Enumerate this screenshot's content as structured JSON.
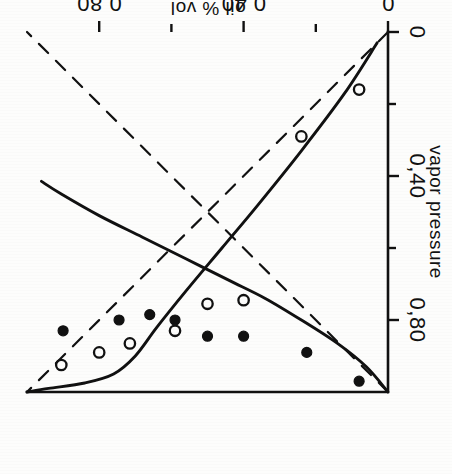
{
  "figure": {
    "rotation_deg": 180,
    "background_color": "#fdfdfc",
    "ink_color": "#111111"
  },
  "chart_data": {
    "type": "scatter",
    "title": "",
    "subtitle": "",
    "xlabel": "oil % vol",
    "ylabel": "vapor pressure",
    "xlim": [
      0,
      1.0
    ],
    "ylim": [
      0,
      1.0
    ],
    "grid": false,
    "legend_position": "none",
    "decimal_separator": ",",
    "x_ticks": [
      {
        "value": 0.0,
        "label": "0",
        "major": true
      },
      {
        "value": 0.2,
        "label": "",
        "major": false
      },
      {
        "value": 0.4,
        "label": "0,40",
        "major": true
      },
      {
        "value": 0.6,
        "label": "",
        "major": false
      },
      {
        "value": 0.8,
        "label": "0,80",
        "major": true
      }
    ],
    "y_ticks": [
      {
        "value": 0.0,
        "label": "0",
        "major": true
      },
      {
        "value": 0.2,
        "label": "",
        "major": false
      },
      {
        "value": 0.4,
        "label": "0,40",
        "major": true
      },
      {
        "value": 0.6,
        "label": "",
        "major": false
      },
      {
        "value": 0.8,
        "label": "0,80",
        "major": true
      }
    ],
    "series": [
      {
        "name": "filled-circles",
        "marker": "filled-circle",
        "type": "scatter",
        "points": [
          {
            "x": 0.08,
            "y": 0.97
          },
          {
            "x": 0.225,
            "y": 0.89
          },
          {
            "x": 0.4,
            "y": 0.845
          },
          {
            "x": 0.5,
            "y": 0.845
          },
          {
            "x": 0.59,
            "y": 0.8
          },
          {
            "x": 0.66,
            "y": 0.785
          },
          {
            "x": 0.745,
            "y": 0.8
          },
          {
            "x": 0.9,
            "y": 0.83
          }
        ]
      },
      {
        "name": "open-circles",
        "marker": "open-circle",
        "type": "scatter",
        "points": [
          {
            "x": 0.08,
            "y": 0.16
          },
          {
            "x": 0.24,
            "y": 0.29
          },
          {
            "x": 0.4,
            "y": 0.745
          },
          {
            "x": 0.5,
            "y": 0.755
          },
          {
            "x": 0.59,
            "y": 0.83
          },
          {
            "x": 0.715,
            "y": 0.865
          },
          {
            "x": 0.8,
            "y": 0.89
          },
          {
            "x": 0.905,
            "y": 0.925
          }
        ]
      },
      {
        "name": "dew-curve",
        "marker": "none",
        "type": "line",
        "style": "solid",
        "points": [
          {
            "x": 0.0,
            "y": 1.0
          },
          {
            "x": 0.06,
            "y": 0.93
          },
          {
            "x": 0.14,
            "y": 0.865
          },
          {
            "x": 0.24,
            "y": 0.8
          },
          {
            "x": 0.34,
            "y": 0.74
          },
          {
            "x": 0.44,
            "y": 0.69
          },
          {
            "x": 0.56,
            "y": 0.63
          },
          {
            "x": 0.68,
            "y": 0.57
          },
          {
            "x": 0.8,
            "y": 0.51
          },
          {
            "x": 0.905,
            "y": 0.45
          },
          {
            "x": 0.96,
            "y": 0.415
          }
        ]
      },
      {
        "name": "bubble-curve",
        "marker": "none",
        "type": "line",
        "style": "solid",
        "points": [
          {
            "x": 0.03,
            "y": 0.03
          },
          {
            "x": 0.12,
            "y": 0.17
          },
          {
            "x": 0.24,
            "y": 0.33
          },
          {
            "x": 0.36,
            "y": 0.48
          },
          {
            "x": 0.46,
            "y": 0.6
          },
          {
            "x": 0.56,
            "y": 0.72
          },
          {
            "x": 0.64,
            "y": 0.82
          },
          {
            "x": 0.7,
            "y": 0.9
          },
          {
            "x": 0.76,
            "y": 0.95
          },
          {
            "x": 0.84,
            "y": 0.975
          },
          {
            "x": 0.94,
            "y": 0.99
          },
          {
            "x": 1.0,
            "y": 1.0
          }
        ]
      },
      {
        "name": "raoult-line-rising",
        "marker": "none",
        "type": "line",
        "style": "dashed",
        "points": [
          {
            "x": 0.0,
            "y": 0.0
          },
          {
            "x": 1.0,
            "y": 1.0
          }
        ]
      },
      {
        "name": "raoult-line-falling",
        "marker": "none",
        "type": "line",
        "style": "dashed",
        "points": [
          {
            "x": 0.0,
            "y": 1.0
          },
          {
            "x": 1.0,
            "y": 0.0
          }
        ]
      }
    ]
  }
}
